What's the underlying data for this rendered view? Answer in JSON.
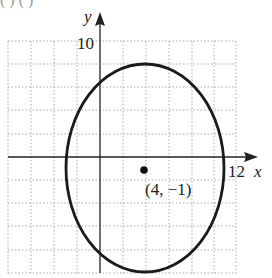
{
  "figure": {
    "top_clipped_text": "(     )                    (           )",
    "axes": {
      "x_label": "x",
      "y_label": "y",
      "x_tick_label": "12",
      "y_tick_label": "10",
      "grid_step": 2,
      "x_range": [
        -8,
        12
      ],
      "y_range": [
        -10,
        10
      ]
    },
    "ellipse": {
      "center": [
        4,
        -1
      ],
      "semi_axis_x": 7,
      "semi_axis_y": 9
    },
    "center_point": {
      "label": "(4, −1)"
    }
  }
}
